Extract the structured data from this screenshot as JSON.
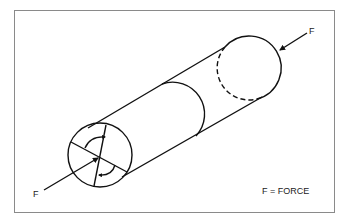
{
  "diagram": {
    "labels": {
      "force_left": "F",
      "force_right": "F",
      "legend": "F = FORCE"
    },
    "colors": {
      "line": "#111111",
      "frame": "#8a8a8a",
      "background": "#ffffff"
    }
  }
}
